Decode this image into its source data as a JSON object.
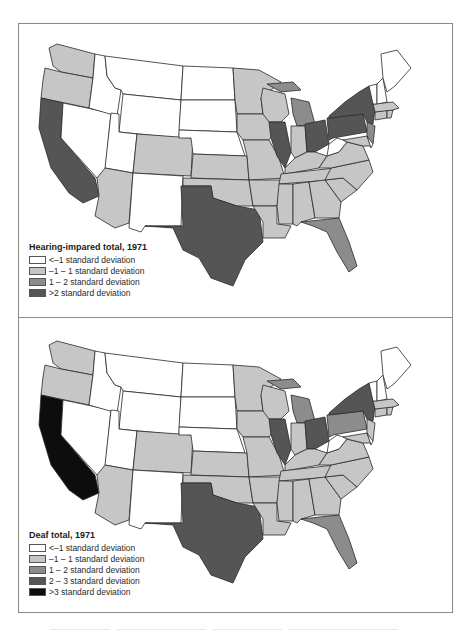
{
  "colors": {
    "lt_minus1": "#ffffff",
    "minus1_to_1": "#c6c6c6",
    "one_to_two": "#8c8c8c",
    "two_to_three": "#555555",
    "gt_three": "#0d0d0d",
    "frame": "#8a8a8a"
  },
  "maps": [
    {
      "id": "hearing-impaired",
      "legend": {
        "title": "Hearing-impared total, 1971",
        "items": [
          {
            "label": "<–1 standard deviation",
            "color": "#ffffff"
          },
          {
            "label": "–1 – 1 standard deviation",
            "color": "#c6c6c6"
          },
          {
            "label": "1 – 2 standard deviation",
            "color": "#8c8c8c"
          },
          {
            "label": ">2 standard deviation",
            "color": "#555555"
          }
        ]
      },
      "state_classes": {
        "WA": "minus1_to_1",
        "OR": "minus1_to_1",
        "CA": "gt2",
        "NV": "lt_minus1",
        "ID": "lt_minus1",
        "MT": "lt_minus1",
        "WY": "lt_minus1",
        "UT": "lt_minus1",
        "AZ": "minus1_to_1",
        "CO": "minus1_to_1",
        "NM": "lt_minus1",
        "ND": "lt_minus1",
        "SD": "lt_minus1",
        "NE": "lt_minus1",
        "KS": "minus1_to_1",
        "OK": "minus1_to_1",
        "TX": "gt2",
        "MN": "minus1_to_1",
        "IA": "minus1_to_1",
        "MO": "minus1_to_1",
        "AR": "minus1_to_1",
        "LA": "minus1_to_1",
        "WI": "minus1_to_1",
        "IL": "gt2",
        "MI": "one_to_two",
        "IN": "minus1_to_1",
        "OH": "gt2",
        "KY": "minus1_to_1",
        "TN": "minus1_to_1",
        "MS": "minus1_to_1",
        "AL": "minus1_to_1",
        "GA": "minus1_to_1",
        "FL": "one_to_two",
        "SC": "minus1_to_1",
        "NC": "minus1_to_1",
        "VA": "minus1_to_1",
        "WV": "lt_minus1",
        "PA": "gt2",
        "NY": "gt2",
        "NJ": "one_to_two",
        "MD": "minus1_to_1",
        "DE": "lt_minus1",
        "CT": "minus1_to_1",
        "RI": "minus1_to_1",
        "MA": "minus1_to_1",
        "VT": "lt_minus1",
        "NH": "lt_minus1",
        "ME": "lt_minus1"
      }
    },
    {
      "id": "deaf",
      "legend": {
        "title": "Deaf total, 1971",
        "items": [
          {
            "label": "<–1 standard deviation",
            "color": "#ffffff"
          },
          {
            "label": "–1 – 1 standard deviation",
            "color": "#c6c6c6"
          },
          {
            "label": "1 – 2 standard deviation",
            "color": "#8c8c8c"
          },
          {
            "label": "2 – 3 standard deviation",
            "color": "#555555"
          },
          {
            "label": ">3 standard deviation",
            "color": "#0d0d0d"
          }
        ]
      },
      "state_classes": {
        "WA": "minus1_to_1",
        "OR": "minus1_to_1",
        "CA": "gt3",
        "NV": "lt_minus1",
        "ID": "lt_minus1",
        "MT": "lt_minus1",
        "WY": "lt_minus1",
        "UT": "lt_minus1",
        "AZ": "minus1_to_1",
        "CO": "minus1_to_1",
        "NM": "lt_minus1",
        "ND": "lt_minus1",
        "SD": "lt_minus1",
        "NE": "lt_minus1",
        "KS": "minus1_to_1",
        "OK": "minus1_to_1",
        "TX": "two_to_three",
        "MN": "minus1_to_1",
        "IA": "minus1_to_1",
        "MO": "minus1_to_1",
        "AR": "minus1_to_1",
        "LA": "minus1_to_1",
        "WI": "minus1_to_1",
        "IL": "two_to_three",
        "MI": "one_to_two",
        "IN": "minus1_to_1",
        "OH": "two_to_three",
        "KY": "minus1_to_1",
        "TN": "minus1_to_1",
        "MS": "minus1_to_1",
        "AL": "minus1_to_1",
        "GA": "minus1_to_1",
        "FL": "one_to_two",
        "SC": "minus1_to_1",
        "NC": "minus1_to_1",
        "VA": "minus1_to_1",
        "WV": "lt_minus1",
        "PA": "one_to_two",
        "NY": "two_to_three",
        "NJ": "minus1_to_1",
        "MD": "minus1_to_1",
        "DE": "lt_minus1",
        "CT": "minus1_to_1",
        "RI": "minus1_to_1",
        "MA": "minus1_to_1",
        "VT": "lt_minus1",
        "NH": "lt_minus1",
        "ME": "lt_minus1"
      }
    }
  ]
}
